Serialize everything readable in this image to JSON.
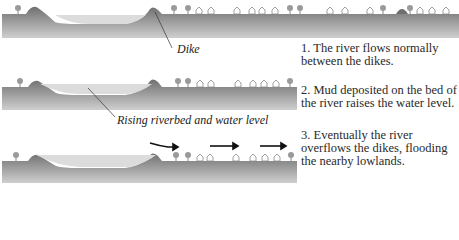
{
  "labels": {
    "dike": "Dike",
    "rising": "Rising riverbed and water level"
  },
  "steps": [
    {
      "text": "1. The river flows normally between the dikes."
    },
    {
      "text": "2. Mud deposited on the bed of the river raises the water level."
    },
    {
      "text": "3. Eventually the river overflows the dikes, flooding the nearby lowlands."
    }
  ],
  "colors": {
    "ground_top": "#6f6f6f",
    "ground_bottom": "#c9c9c9",
    "water": "#d8d8d8",
    "ink": "#222222"
  }
}
